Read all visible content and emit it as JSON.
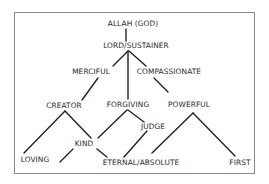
{
  "diagram": {
    "colors": {
      "line": "#222222",
      "text": "#2a2a2a",
      "border": "#8a8a8a",
      "background": "#ffffff"
    },
    "nodes": [
      {
        "id": "allah",
        "label": "ALLAH (GOD)",
        "x": 133,
        "y": 24
      },
      {
        "id": "lord",
        "label": "LORD/SUSTAINER",
        "x": 136,
        "y": 46
      },
      {
        "id": "merciful",
        "label": "MERCIFUL",
        "x": 91,
        "y": 72
      },
      {
        "id": "compassionate",
        "label": "COMPASSIONATE",
        "x": 169,
        "y": 72
      },
      {
        "id": "creator",
        "label": "CREATOR",
        "x": 64,
        "y": 106
      },
      {
        "id": "forgiving",
        "label": "FORGIVING",
        "x": 128,
        "y": 105
      },
      {
        "id": "powerful",
        "label": "POWERFUL",
        "x": 189,
        "y": 105
      },
      {
        "id": "judge",
        "label": "JUDGE",
        "x": 153,
        "y": 127
      },
      {
        "id": "kind",
        "label": "KIND",
        "x": 84,
        "y": 144
      },
      {
        "id": "loving",
        "label": "LOVING",
        "x": 35,
        "y": 160
      },
      {
        "id": "eternal",
        "label": "ETERNAL/ABSOLUTE",
        "x": 141,
        "y": 163
      },
      {
        "id": "first",
        "label": "FIRST",
        "x": 240,
        "y": 163
      }
    ],
    "edges": [
      {
        "from": "allah",
        "to": "lord",
        "x1": 126,
        "y1": 29,
        "x2": 126,
        "y2": 41
      },
      {
        "from": "lord",
        "to": "merciful",
        "x1": 128,
        "y1": 51,
        "x2": 113,
        "y2": 66
      },
      {
        "from": "lord",
        "to": "forgiving",
        "x1": 128,
        "y1": 51,
        "x2": 128,
        "y2": 99
      },
      {
        "from": "lord",
        "to": "compassionate",
        "x1": 129,
        "y1": 51,
        "x2": 146,
        "y2": 66
      },
      {
        "from": "merciful",
        "to": "creator",
        "x1": 98,
        "y1": 78,
        "x2": 82,
        "y2": 100
      },
      {
        "from": "compassionate",
        "to": "powerful",
        "x1": 154,
        "y1": 78,
        "x2": 168,
        "y2": 92
      },
      {
        "from": "creator",
        "to": "loving",
        "x1": 65,
        "y1": 111,
        "x2": 24,
        "y2": 153
      },
      {
        "from": "creator",
        "to": "kind",
        "x1": 65,
        "y1": 111,
        "x2": 91,
        "y2": 138
      },
      {
        "from": "forgiving",
        "to": "kind",
        "x1": 127,
        "y1": 110,
        "x2": 98,
        "y2": 138
      },
      {
        "from": "forgiving",
        "to": "judge",
        "x1": 128,
        "y1": 110,
        "x2": 144,
        "y2": 122
      },
      {
        "from": "kind",
        "to": "loving-side",
        "x1": 73,
        "y1": 149,
        "x2": 60,
        "y2": 162
      },
      {
        "from": "kind",
        "to": "eternal",
        "x1": 97,
        "y1": 149,
        "x2": 107,
        "y2": 157
      },
      {
        "from": "judge",
        "to": "eternal",
        "x1": 147,
        "y1": 131,
        "x2": 124,
        "y2": 157
      },
      {
        "from": "powerful",
        "to": "eternal",
        "x1": 193,
        "y1": 113,
        "x2": 152,
        "y2": 153
      },
      {
        "from": "powerful",
        "to": "first",
        "x1": 193,
        "y1": 113,
        "x2": 235,
        "y2": 156
      }
    ]
  }
}
